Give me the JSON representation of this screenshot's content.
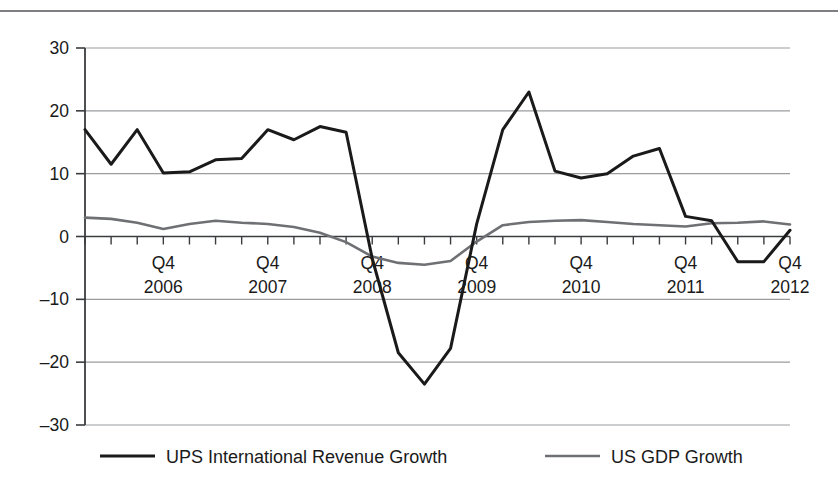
{
  "chart_data": {
    "type": "line",
    "title": "",
    "subtitle": "",
    "xlabel": "",
    "ylabel": "",
    "ylim": [
      -30,
      30
    ],
    "yticks": [
      30,
      20,
      10,
      0,
      -10,
      -20,
      -30
    ],
    "ytick_labels": [
      "30",
      "20",
      "10",
      "0",
      "–10",
      "–20",
      "–30"
    ],
    "grid": true,
    "grid_axis": "y",
    "legend_position": "bottom",
    "x_tick_labels": [
      {
        "line1": "Q4",
        "line2": "2006",
        "index": 3
      },
      {
        "line1": "Q4",
        "line2": "2007",
        "index": 7
      },
      {
        "line1": "Q4",
        "line2": "2008",
        "index": 11
      },
      {
        "line1": "Q4",
        "line2": "2009",
        "index": 15
      },
      {
        "line1": "Q4",
        "line2": "2010",
        "index": 19
      },
      {
        "line1": "Q4",
        "line2": "2011",
        "index": 23
      },
      {
        "line1": "Q4",
        "line2": "2012",
        "index": 27
      }
    ],
    "x": [
      "2006Q1",
      "2006Q2",
      "2006Q3",
      "2006Q4",
      "2007Q1",
      "2007Q2",
      "2007Q3",
      "2007Q4",
      "2008Q1",
      "2008Q2",
      "2008Q3",
      "2008Q4",
      "2009Q1",
      "2009Q2",
      "2009Q3",
      "2009Q4",
      "2010Q1",
      "2010Q2",
      "2010Q3",
      "2010Q4",
      "2011Q1",
      "2011Q2",
      "2011Q3",
      "2011Q4",
      "2012Q1",
      "2012Q2",
      "2012Q3",
      "2012Q4"
    ],
    "series": [
      {
        "name": "UPS International Revenue Growth",
        "color": "#1a1a1a",
        "width": 3.0,
        "values": [
          17.0,
          11.5,
          17.0,
          10.1,
          10.3,
          12.2,
          12.4,
          17.0,
          15.4,
          17.5,
          16.6,
          -3.5,
          -18.5,
          -23.5,
          -17.8,
          2.0,
          17.0,
          23.0,
          10.4,
          9.3,
          10.0,
          12.8,
          14.0,
          3.2,
          2.5,
          -4.0,
          -4.0,
          1.0
        ]
      },
      {
        "name": "US GDP Growth",
        "color": "#6e7073",
        "width": 2.6,
        "values": [
          3.0,
          2.8,
          2.2,
          1.2,
          2.0,
          2.5,
          2.2,
          2.0,
          1.5,
          0.6,
          -0.9,
          -3.2,
          -4.2,
          -4.5,
          -3.9,
          -0.8,
          1.8,
          2.3,
          2.5,
          2.6,
          2.3,
          2.0,
          1.8,
          1.6,
          2.1,
          2.2,
          2.4,
          1.9
        ]
      }
    ]
  },
  "legend": {
    "items": [
      {
        "label": "UPS International Revenue Growth",
        "color": "#1a1a1a",
        "swatch": "black-line-swatch"
      },
      {
        "label": "US GDP Growth",
        "color": "#6e7073",
        "swatch": "gray-line-swatch"
      }
    ]
  },
  "colors": {
    "ups_line": "#1a1a1a",
    "gdp_line": "#6e7073",
    "grid": "#9a9c9f",
    "axis": "#3a3c3f",
    "background": "#ffffff",
    "top_rule": "#7d7f82"
  }
}
